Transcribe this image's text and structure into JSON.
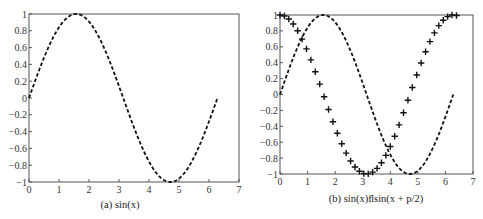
{
  "chart_data": [
    {
      "type": "line",
      "title": "",
      "caption": "(a) sin(x)",
      "xlabel": "",
      "ylabel": "",
      "xlim": [
        0,
        7
      ],
      "ylim": [
        -1,
        1
      ],
      "xticks": [
        "0",
        "1",
        "2",
        "3",
        "4",
        "5",
        "6",
        "7"
      ],
      "yticks": [
        "1",
        "0.8",
        "0.6",
        "0.4",
        "0.2",
        "0",
        "−0.2",
        "−0.4",
        "−0.6",
        "−0.8",
        "−1"
      ],
      "grid": false,
      "series": [
        {
          "name": "sin(x)",
          "style": "dashed",
          "function": "sin(x)",
          "x_range": [
            0,
            6.2832
          ]
        }
      ]
    },
    {
      "type": "line",
      "title": "",
      "caption": "(b) sin(x)ﬂsin(x + p/2)",
      "xlabel": "",
      "ylabel": "",
      "xlim": [
        0,
        7
      ],
      "ylim": [
        -1,
        1
      ],
      "xticks": [
        "0",
        "1",
        "2",
        "3",
        "4",
        "5",
        "6",
        "7"
      ],
      "yticks": [
        "1",
        "0.8",
        "0.6",
        "0.4",
        "0.2",
        "0",
        "−0.2",
        "−0.4",
        "−0.6",
        "−0.8",
        "−1"
      ],
      "grid": false,
      "series": [
        {
          "name": "sin(x)",
          "style": "dashed",
          "function": "sin(x)",
          "x_range": [
            0,
            6.2832
          ]
        },
        {
          "name": "sin(x + p/2)",
          "style": "plus-markers",
          "function": "sin(x + pi/2)",
          "x_range": [
            0,
            6.4
          ],
          "step": 0.16
        }
      ]
    }
  ],
  "colors": {
    "line": "#111111",
    "axes": "#555555",
    "text": "#333333"
  }
}
